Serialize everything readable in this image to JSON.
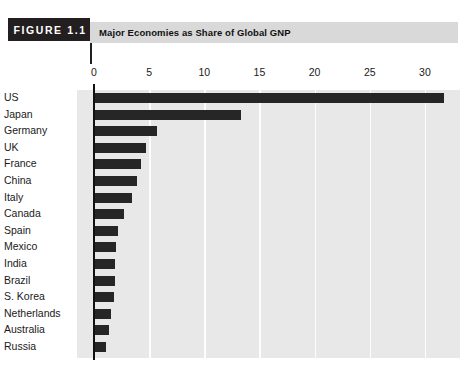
{
  "figure": {
    "badge_label": "FIGURE 1.1",
    "title": "Major Economies as Share of Global GNP"
  },
  "chart_data": {
    "type": "bar",
    "orientation": "horizontal",
    "title": "Major Economies as Share of Global GNP",
    "xlabel": "",
    "ylabel": "",
    "xlim": [
      0,
      33.5
    ],
    "xticks": [
      0,
      5,
      10,
      15,
      20,
      25,
      30
    ],
    "xtick_labels": [
      "0",
      "5",
      "10",
      "15",
      "20",
      "25",
      "30"
    ],
    "grid": true,
    "grid_axis": "x",
    "legend": false,
    "categories": [
      "US",
      "Japan",
      "Germany",
      "UK",
      "France",
      "China",
      "Italy",
      "Canada",
      "Spain",
      "Mexico",
      "India",
      "Brazil",
      "S. Korea",
      "Netherlands",
      "Australia",
      "Russia"
    ],
    "values": [
      31.7,
      13.3,
      5.7,
      4.7,
      4.3,
      3.9,
      3.4,
      2.7,
      2.2,
      2.0,
      1.9,
      1.9,
      1.8,
      1.5,
      1.4,
      1.1
    ],
    "bar_color": "#262626",
    "plot_background": "#e8e8e8",
    "gridline_color": "#fdfdfd"
  }
}
